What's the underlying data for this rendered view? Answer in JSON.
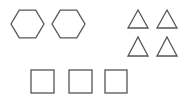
{
  "canvas": {
    "width": 191,
    "height": 98,
    "background": "#ffffff"
  },
  "stroke": {
    "color": "#555555",
    "width": 1.3
  },
  "groups": {
    "hexagons": {
      "count": 2,
      "items": [
        {
          "cx": 27.5,
          "cy": 24,
          "r": 16.5
        },
        {
          "cx": 68.5,
          "cy": 24,
          "r": 16.5
        }
      ]
    },
    "triangles": {
      "count": 4,
      "items": [
        {
          "x1": 128,
          "x2": 148,
          "top": 10,
          "bottom": 28
        },
        {
          "x1": 157,
          "x2": 177,
          "top": 10,
          "bottom": 28
        },
        {
          "x1": 128,
          "x2": 148,
          "top": 37,
          "bottom": 56
        },
        {
          "x1": 157,
          "x2": 177,
          "top": 37,
          "bottom": 56
        }
      ]
    },
    "squares": {
      "count": 3,
      "items": [
        {
          "x": 31,
          "y": 70,
          "w": 23,
          "h": 23
        },
        {
          "x": 69,
          "y": 70,
          "w": 23,
          "h": 23
        },
        {
          "x": 105,
          "y": 70,
          "w": 22,
          "h": 23
        }
      ]
    }
  }
}
